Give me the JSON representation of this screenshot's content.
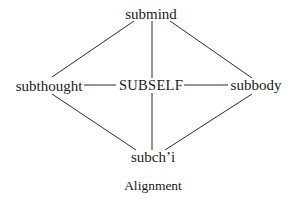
{
  "diagram": {
    "nodes": {
      "top": "submind",
      "left": "subthought",
      "center": "SUBSELF",
      "right": "subbody",
      "bottom": "subch’i"
    },
    "edges": [
      [
        "submind",
        "subthought"
      ],
      [
        "submind",
        "SUBSELF"
      ],
      [
        "submind",
        "subbody"
      ],
      [
        "subthought",
        "SUBSELF"
      ],
      [
        "SUBSELF",
        "subbody"
      ],
      [
        "subthought",
        "subch’i"
      ],
      [
        "SUBSELF",
        "subch’i"
      ],
      [
        "subbody",
        "subch’i"
      ]
    ],
    "caption": "Alignment"
  }
}
